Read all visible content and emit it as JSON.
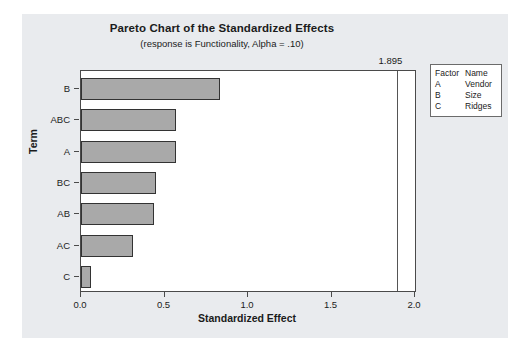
{
  "chart_data": {
    "type": "bar",
    "orientation": "horizontal",
    "title": "Pareto Chart of the Standardized Effects",
    "subtitle": "(response is Functionality, Alpha = .10)",
    "xlabel": "Standardized Effect",
    "ylabel": "Term",
    "categories": [
      "B",
      "ABC",
      "A",
      "BC",
      "AB",
      "AC",
      "C"
    ],
    "values": [
      0.83,
      0.57,
      0.57,
      0.45,
      0.44,
      0.31,
      0.06
    ],
    "xlim": [
      0.0,
      2.0
    ],
    "xticks": [
      0.0,
      0.5,
      1.0,
      1.5,
      2.0
    ],
    "xtick_labels": [
      "0.0",
      "0.5",
      "1.0",
      "1.5",
      "2.0"
    ],
    "grid": false,
    "legend_position": "right-top",
    "reference_line": {
      "value": 1.895,
      "label": "1.895"
    },
    "bar_color": "#a9a9a9",
    "bar_edge_color": "#333333",
    "panel_color": "#e9ebee",
    "plot_background": "#ffffff"
  },
  "legend": {
    "header": {
      "factor": "Factor",
      "name": "Name"
    },
    "rows": [
      {
        "factor": "A",
        "name": "Vendor"
      },
      {
        "factor": "B",
        "name": "Size"
      },
      {
        "factor": "C",
        "name": "Ridges"
      }
    ]
  }
}
